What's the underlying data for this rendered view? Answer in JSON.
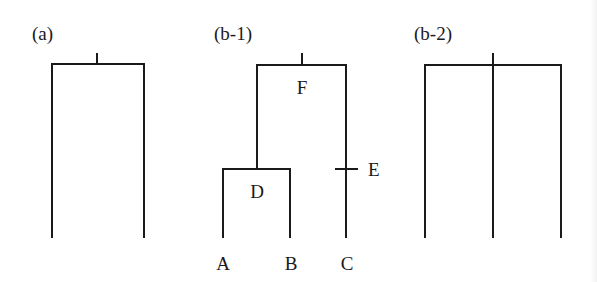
{
  "panels": [
    {
      "id": "a",
      "label": "(a)",
      "description": "Tree with root and two leaves",
      "node_labels": []
    },
    {
      "id": "b-1",
      "label": "(b-1)",
      "description": "Rooted binary tree with leaves A, B, C; internal node D joining A and B; F root; E marks edge to C",
      "node_labels": {
        "F": "F",
        "D": "D",
        "E": "E",
        "A": "A",
        "B": "B",
        "C": "C"
      }
    },
    {
      "id": "b-2",
      "label": "(b-2)",
      "description": "Star tree with root and three leaves",
      "node_labels": []
    }
  ],
  "colors": {
    "line": "#1a1a1a",
    "background": "#ffffff"
  }
}
